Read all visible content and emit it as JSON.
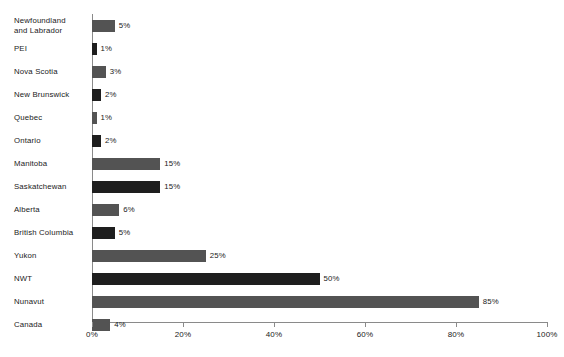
{
  "chart_data": {
    "type": "bar",
    "orientation": "horizontal",
    "title": "",
    "subtitle": "",
    "xlabel": "",
    "ylabel": "",
    "xlim": [
      0,
      100
    ],
    "grid": false,
    "legend": null,
    "categories": [
      "Newfoundland and Labrador",
      "PEI",
      "Nova Scotia",
      "New Brunswick",
      "Quebec",
      "Ontario",
      "Manitoba",
      "Saskatchewan",
      "Alberta",
      "British Columbia",
      "Yukon",
      "NWT",
      "Nunavut",
      "Canada"
    ],
    "values": [
      5,
      1,
      3,
      2,
      1,
      2,
      15,
      15,
      6,
      5,
      25,
      50,
      85,
      4
    ],
    "value_labels": [
      "5%",
      "1%",
      "3%",
      "2%",
      "1%",
      "2%",
      "15%",
      "15%",
      "6%",
      "5%",
      "25%",
      "50%",
      "85%",
      "4%"
    ],
    "bar_colors": [
      "#535353",
      "#1e1e1e",
      "#535353",
      "#1e1e1e",
      "#535353",
      "#1e1e1e",
      "#535353",
      "#1e1e1e",
      "#535353",
      "#1e1e1e",
      "#535353",
      "#1e1e1e",
      "#535353",
      "#535353"
    ],
    "xticks": [
      0,
      20,
      40,
      60,
      80,
      100
    ],
    "xtick_labels": [
      "0%",
      "20%",
      "40%",
      "60%",
      "80%",
      "100%"
    ],
    "axis_color": "#8a8a8a",
    "text_color": "#1a1a1a",
    "background": "#ffffff"
  },
  "rows": [
    {
      "label": "Newfoundland\nand Labrador",
      "value": 5,
      "value_label": "5%",
      "color": "#535353"
    },
    {
      "label": "PEI",
      "value": 1,
      "value_label": "1%",
      "color": "#1e1e1e"
    },
    {
      "label": "Nova Scotia",
      "value": 3,
      "value_label": "3%",
      "color": "#535353"
    },
    {
      "label": "New Brunswick",
      "value": 2,
      "value_label": "2%",
      "color": "#1e1e1e"
    },
    {
      "label": "Quebec",
      "value": 1,
      "value_label": "1%",
      "color": "#535353"
    },
    {
      "label": "Ontario",
      "value": 2,
      "value_label": "2%",
      "color": "#1e1e1e"
    },
    {
      "label": "Manitoba",
      "value": 15,
      "value_label": "15%",
      "color": "#535353"
    },
    {
      "label": "Saskatchewan",
      "value": 15,
      "value_label": "15%",
      "color": "#1e1e1e"
    },
    {
      "label": "Alberta",
      "value": 6,
      "value_label": "6%",
      "color": "#535353"
    },
    {
      "label": "British Columbia",
      "value": 5,
      "value_label": "5%",
      "color": "#1e1e1e"
    },
    {
      "label": "Yukon",
      "value": 25,
      "value_label": "25%",
      "color": "#535353"
    },
    {
      "label": "NWT",
      "value": 50,
      "value_label": "50%",
      "color": "#1e1e1e"
    },
    {
      "label": "Nunavut",
      "value": 85,
      "value_label": "85%",
      "color": "#535353"
    },
    {
      "label": "Canada",
      "value": 4,
      "value_label": "4%",
      "color": "#535353"
    }
  ],
  "axis": {
    "ticks": [
      {
        "value": 0,
        "label": "0%"
      },
      {
        "value": 20,
        "label": "20%"
      },
      {
        "value": 40,
        "label": "40%"
      },
      {
        "value": 60,
        "label": "60%"
      },
      {
        "value": 80,
        "label": "80%"
      },
      {
        "value": 100,
        "label": "100%"
      }
    ]
  }
}
